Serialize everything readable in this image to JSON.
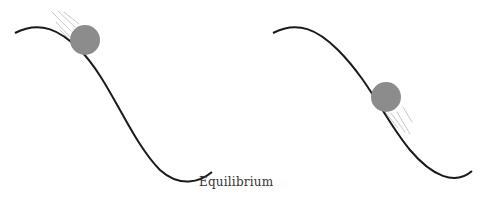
{
  "diagram": {
    "title": "Equilibrium",
    "label": "Equilibrium",
    "colors": {
      "background": "#ffffff",
      "curve": "#1a1a1a",
      "ball": "#8c8c8c",
      "motion_lines": "#c8c8c8",
      "label": "#333333"
    },
    "panels": [
      {
        "id": "left",
        "description": "S-shaped slope with ball near the upper crest, motion lines trailing above-left",
        "curve_path": "M15,33 C40,20 60,30 80,50 C110,80 130,140 160,170 C180,188 200,182 212,172",
        "ball": {
          "cx": 85,
          "cy": 40,
          "r": 15
        },
        "motion_lines": [
          {
            "x1": 52,
            "y1": 12,
            "x2": 70,
            "y2": 30
          },
          {
            "x1": 58,
            "y1": 11,
            "x2": 75,
            "y2": 27
          },
          {
            "x1": 64,
            "y1": 12,
            "x2": 79,
            "y2": 24
          },
          {
            "x1": 56,
            "y1": 22,
            "x2": 70,
            "y2": 37
          },
          {
            "x1": 60,
            "y1": 30,
            "x2": 72,
            "y2": 42
          }
        ]
      },
      {
        "id": "right",
        "description": "S-shaped slope with ball at mid-slope, motion lines trailing below-right",
        "curve_path": "M273,33 C298,20 318,30 338,50 C370,82 385,120 410,150 C432,176 455,186 472,171",
        "ball": {
          "cx": 386,
          "cy": 97,
          "r": 15
        },
        "motion_lines": [
          {
            "x1": 385,
            "y1": 112,
            "x2": 398,
            "y2": 128
          },
          {
            "x1": 391,
            "y1": 113,
            "x2": 405,
            "y2": 132
          },
          {
            "x1": 397,
            "y1": 112,
            "x2": 410,
            "y2": 134
          },
          {
            "x1": 403,
            "y1": 107,
            "x2": 412,
            "y2": 122
          }
        ]
      }
    ]
  }
}
